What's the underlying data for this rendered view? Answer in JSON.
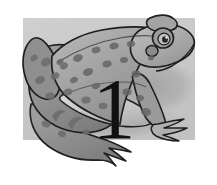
{
  "figure": {
    "name": "frog-number-one",
    "style": "grayscale-illustration",
    "canvas": {
      "width": 217,
      "height": 185,
      "background_color": "#ffffff"
    },
    "panel": {
      "name": "background-panel",
      "shape": "rectangle",
      "x": 23,
      "y": 18,
      "width": 172,
      "height": 122,
      "fill_color": "#c9c9c9"
    },
    "shadow": {
      "name": "cast-shadow",
      "fill_color": "#a9a9a9",
      "description": "soft gray shadow behind the frog toward the right"
    },
    "subject": {
      "name": "frog",
      "species_label": "frog",
      "pose": "sitting in profile, facing right",
      "outline_color": "#1a1a1a",
      "body_fill_color": "#9a9a9a",
      "body_light_color": "#bdbdbd",
      "belly_fill_color": "#d6d6d6",
      "spot_color": "#6a6a6a",
      "eye": {
        "name": "frog-eye",
        "ring_color": "#8a8a8a",
        "pupil_color": "#2a2a2a",
        "highlight_color": "#f2f2f2"
      },
      "parts": [
        "head",
        "eye",
        "tympanum",
        "back",
        "hind-leg",
        "hind-foot",
        "front-leg",
        "front-foot",
        "belly"
      ]
    },
    "numeral": {
      "name": "numeral-one",
      "value": "1",
      "color": "#111111",
      "x": 114,
      "y": 138,
      "font_size_px": 86,
      "description": "large black serif numeral one overlaid on the frog's body"
    }
  }
}
